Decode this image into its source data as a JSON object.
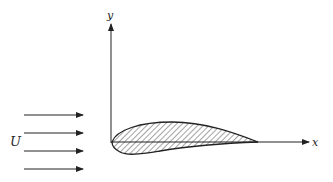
{
  "diagram": {
    "title": "",
    "labels": {
      "y_axis": "y",
      "x_axis": "x",
      "freestream": "U"
    },
    "colors": {
      "stroke": "#222222",
      "background": "#ffffff"
    },
    "elements": {
      "freestream_arrows": 4,
      "airfoil": "cambered airfoil, hatched, leading edge at origin, chord along x-axis"
    }
  }
}
